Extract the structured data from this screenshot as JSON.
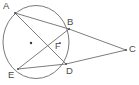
{
  "figure": {
    "type": "circle-geometry-diagram",
    "width": 139,
    "height": 85,
    "background_color": "#ffffff",
    "stroke_color": "#6e6e6e",
    "label_color": "#4a4a4a"
  },
  "circle": {
    "center": {
      "x": 36,
      "y": 42
    },
    "radius_x": 33,
    "radius_y": 36.5,
    "center_dot_label": ""
  },
  "points": [
    {
      "id": "A",
      "label": "A",
      "x": 15,
      "y": 13,
      "label_x": 3,
      "label_y": 1,
      "on_circle": true
    },
    {
      "id": "B",
      "label": "B",
      "x": 69,
      "y": 29,
      "label_x": 67,
      "label_y": 17,
      "on_circle": true
    },
    {
      "id": "C",
      "label": "C",
      "x": 126,
      "y": 50,
      "label_x": 129,
      "label_y": 44,
      "on_circle": false
    },
    {
      "id": "D",
      "label": "D",
      "x": 66,
      "y": 64,
      "label_x": 66,
      "label_y": 66,
      "on_circle": true
    },
    {
      "id": "E",
      "label": "E",
      "x": 18,
      "y": 69,
      "label_x": 8,
      "label_y": 70,
      "on_circle": true
    },
    {
      "id": "F",
      "label": "F",
      "x": 60,
      "y": 43,
      "label_x": 55,
      "label_y": 41,
      "on_circle": false
    }
  ],
  "segments": [
    {
      "name": "chord-AB",
      "from": "A",
      "to": "B"
    },
    {
      "name": "chord-AD",
      "from": "A",
      "to": "D"
    },
    {
      "name": "chord-EB",
      "from": "E",
      "to": "B"
    },
    {
      "name": "chord-ED",
      "from": "E",
      "to": "D"
    },
    {
      "name": "secant-BC",
      "from": "B",
      "to": "C"
    },
    {
      "name": "secant-DC",
      "from": "D",
      "to": "C"
    }
  ],
  "labels": {
    "A": "A",
    "B": "B",
    "C": "C",
    "D": "D",
    "E": "E",
    "F": "F"
  }
}
